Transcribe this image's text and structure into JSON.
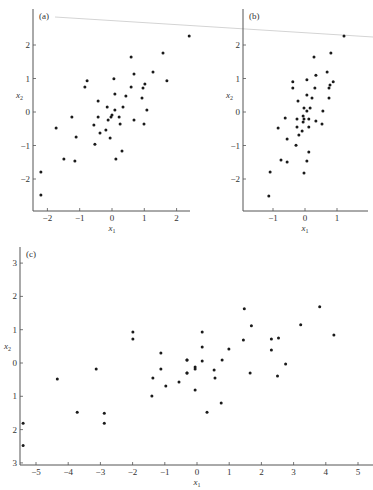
{
  "figure": {
    "background": "#ffffff",
    "ink": "#1a1a1a",
    "artifact_line_color": "#cfcfcf"
  },
  "chart_data": [
    {
      "id": "a",
      "type": "scatter",
      "panel_label": "(a)",
      "xlabel": "x1",
      "ylabel": "x2",
      "xticks": [
        -2,
        -1,
        0,
        1,
        2
      ],
      "yticks": [
        -2,
        -1,
        0,
        1,
        2
      ],
      "xtick_labels": [
        "−2",
        "−1",
        "0",
        "1",
        "2"
      ],
      "ytick_labels": [
        "−2",
        "−1",
        "0",
        "1",
        "2"
      ],
      "xlim": [
        -2.3,
        2.4
      ],
      "ylim": [
        -2.95,
        2.95
      ],
      "grid": false,
      "points": [
        [
          2.39,
          2.27
        ],
        [
          1.58,
          1.76
        ],
        [
          0.59,
          1.64
        ],
        [
          1.27,
          1.19
        ],
        [
          0.06,
          0.99
        ],
        [
          0.68,
          1.13
        ],
        [
          -0.77,
          0.93
        ],
        [
          -0.84,
          0.75
        ],
        [
          1.7,
          0.93
        ],
        [
          1.02,
          0.84
        ],
        [
          0.59,
          0.75
        ],
        [
          0.96,
          0.72
        ],
        [
          0.09,
          0.54
        ],
        [
          0.43,
          0.48
        ],
        [
          -0.43,
          0.33
        ],
        [
          0.93,
          0.42
        ],
        [
          -0.15,
          0.15
        ],
        [
          0.09,
          0.06
        ],
        [
          0.34,
          0.15
        ],
        [
          1.08,
          0.06
        ],
        [
          -1.24,
          -0.15
        ],
        [
          -0.43,
          -0.15
        ],
        [
          0.0,
          -0.09
        ],
        [
          -0.03,
          -0.15
        ],
        [
          0.22,
          -0.15
        ],
        [
          -0.12,
          -0.24
        ],
        [
          0.68,
          -0.24
        ],
        [
          0.99,
          -0.36
        ],
        [
          -0.56,
          -0.39
        ],
        [
          0.25,
          -0.36
        ],
        [
          -1.73,
          -0.48
        ],
        [
          -0.19,
          -0.54
        ],
        [
          -0.37,
          -0.63
        ],
        [
          -1.11,
          -0.75
        ],
        [
          -0.06,
          -0.78
        ],
        [
          -0.53,
          -0.96
        ],
        [
          0.31,
          -1.16
        ],
        [
          -1.49,
          -1.4
        ],
        [
          0.12,
          -1.4
        ],
        [
          -1.15,
          -1.46
        ],
        [
          -2.2,
          -1.79
        ],
        [
          -2.2,
          -2.48
        ]
      ]
    },
    {
      "id": "b",
      "type": "scatter",
      "panel_label": "(b)",
      "xlabel": "x1",
      "ylabel": "x2",
      "xticks": [
        -1,
        0,
        1
      ],
      "yticks": [
        -2,
        -1,
        0,
        1,
        2
      ],
      "xtick_labels": [
        "−1",
        "0",
        "1"
      ],
      "ytick_labels": [
        "−2",
        "−1",
        "0",
        "1",
        "2"
      ],
      "xlim": [
        -1.95,
        1.95
      ],
      "ylim": [
        -2.95,
        2.95
      ],
      "grid": false,
      "points": [
        [
          1.22,
          2.27
        ],
        [
          0.81,
          1.76
        ],
        [
          0.28,
          1.64
        ],
        [
          0.69,
          1.19
        ],
        [
          0.34,
          1.1
        ],
        [
          -0.38,
          0.9
        ],
        [
          0.88,
          0.9
        ],
        [
          0.06,
          0.96
        ],
        [
          -0.38,
          0.72
        ],
        [
          0.31,
          0.72
        ],
        [
          0.78,
          0.81
        ],
        [
          0.75,
          0.72
        ],
        [
          0.06,
          0.51
        ],
        [
          -0.22,
          0.33
        ],
        [
          0.22,
          0.42
        ],
        [
          0.75,
          0.42
        ],
        [
          -0.03,
          0.12
        ],
        [
          0.06,
          0.03
        ],
        [
          0.16,
          0.12
        ],
        [
          0.56,
          0.03
        ],
        [
          -0.62,
          -0.18
        ],
        [
          -0.25,
          -0.21
        ],
        [
          -0.06,
          -0.12
        ],
        [
          -0.03,
          -0.21
        ],
        [
          0.12,
          -0.21
        ],
        [
          -0.06,
          -0.3
        ],
        [
          0.34,
          -0.27
        ],
        [
          0.53,
          -0.36
        ],
        [
          -0.84,
          -0.48
        ],
        [
          -0.25,
          -0.45
        ],
        [
          0.12,
          -0.45
        ],
        [
          -0.19,
          -0.69
        ],
        [
          -0.56,
          -0.81
        ],
        [
          -0.09,
          -0.57
        ],
        [
          -0.28,
          -0.99
        ],
        [
          0.12,
          -1.19
        ],
        [
          -0.75,
          -1.43
        ],
        [
          -0.56,
          -1.49
        ],
        [
          0.06,
          -1.46
        ],
        [
          -0.03,
          -1.82
        ],
        [
          -1.09,
          -1.79
        ],
        [
          -1.13,
          -2.51
        ]
      ]
    },
    {
      "id": "c",
      "type": "scatter",
      "panel_label": "(c)",
      "xlabel": "x1",
      "ylabel": "x2",
      "xticks": [
        -5,
        -4,
        -3,
        -2,
        -1,
        0,
        1,
        2,
        3,
        4,
        5
      ],
      "yticks": [
        3,
        2,
        1,
        0,
        -1,
        -2,
        -3
      ],
      "xtick_labels": [
        "−5",
        "−4",
        "−3",
        "−2",
        "−1",
        "0",
        "1",
        "2",
        "3",
        "4",
        "5"
      ],
      "ytick_labels": [
        "3",
        "2",
        "1",
        "0",
        "1",
        "2",
        "3"
      ],
      "xlim": [
        -5.45,
        5.5
      ],
      "ylim": [
        -3.05,
        3.55
      ],
      "grid": false,
      "points": [
        [
          -1.99,
          0.93
        ],
        [
          -1.99,
          0.72
        ],
        [
          -1.12,
          0.3
        ],
        [
          -0.31,
          0.09
        ],
        [
          -3.13,
          -0.18
        ],
        [
          -1.12,
          -0.18
        ],
        [
          -4.34,
          -0.48
        ],
        [
          -1.37,
          -0.45
        ],
        [
          -0.31,
          -0.3
        ],
        [
          -0.56,
          -0.57
        ],
        [
          -0.97,
          -0.69
        ],
        [
          -1.4,
          -0.99
        ],
        [
          -3.72,
          -1.48
        ],
        [
          -2.88,
          -1.51
        ],
        [
          -2.88,
          -1.81
        ],
        [
          -5.4,
          -1.81
        ],
        [
          -5.4,
          -2.48
        ],
        [
          1.47,
          1.63
        ],
        [
          3.81,
          1.69
        ],
        [
          1.69,
          1.12
        ],
        [
          3.22,
          1.15
        ],
        [
          0.16,
          0.93
        ],
        [
          4.25,
          0.84
        ],
        [
          1.44,
          0.69
        ],
        [
          2.31,
          0.72
        ],
        [
          2.53,
          0.75
        ],
        [
          0.16,
          0.48
        ],
        [
          0.99,
          0.42
        ],
        [
          2.31,
          0.39
        ],
        [
          -0.31,
          0.09
        ],
        [
          0.16,
          0.06
        ],
        [
          0.78,
          0.09
        ],
        [
          2.75,
          -0.03
        ],
        [
          -0.06,
          -0.12
        ],
        [
          -0.06,
          -0.18
        ],
        [
          0.53,
          -0.21
        ],
        [
          -0.31,
          -0.3
        ],
        [
          1.65,
          -0.3
        ],
        [
          0.56,
          -0.45
        ],
        [
          2.5,
          -0.39
        ],
        [
          -0.06,
          -0.81
        ],
        [
          0.75,
          -1.2
        ],
        [
          0.31,
          -1.48
        ]
      ]
    }
  ],
  "panels_layout": {
    "a": {
      "x_origin_px": 112,
      "x_unit_px": 32.3,
      "y_origin_px": 112,
      "y_unit_px": 33.5,
      "axis_left_px": 33,
      "axis_bottom_px": 211,
      "axis_right_px": 190,
      "axis_top_px": 9
    },
    "b": {
      "x_origin_px": 305,
      "x_unit_px": 32,
      "y_origin_px": 112,
      "y_unit_px": 33.5,
      "axis_left_px": 243,
      "axis_bottom_px": 211,
      "axis_right_px": 368,
      "axis_top_px": 9
    },
    "c": {
      "x_origin_px": 197,
      "x_unit_px": 32.2,
      "y_origin_px": 363,
      "y_unit_px": 33.3,
      "axis_left_px": 20,
      "axis_bottom_px": 465,
      "axis_right_px": 373,
      "axis_top_px": 247
    }
  }
}
